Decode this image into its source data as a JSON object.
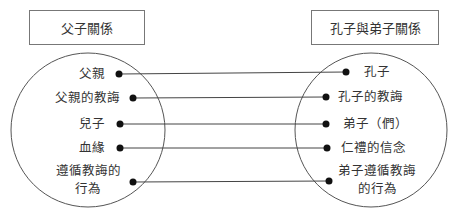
{
  "left_group": {
    "title": "父子關係",
    "items": [
      {
        "label": "父親"
      },
      {
        "label": "父親的教誨"
      },
      {
        "label": "兒子"
      },
      {
        "label": "血緣"
      },
      {
        "label": "遵循教誨的",
        "label2": "行為"
      }
    ]
  },
  "right_group": {
    "title": "孔子與弟子關係",
    "items": [
      {
        "label": "孔子"
      },
      {
        "label": "孔子的教誨"
      },
      {
        "label": "弟子（們）"
      },
      {
        "label": "仁禮的信念"
      },
      {
        "label": "弟子遵循教誨",
        "label2": "的行為"
      }
    ]
  },
  "colors": {
    "line": "#444444",
    "dot": "#111111",
    "circle": "#555555",
    "box_border": "#777777"
  }
}
